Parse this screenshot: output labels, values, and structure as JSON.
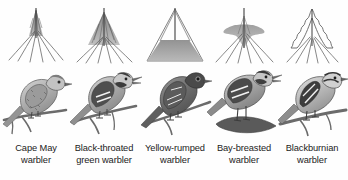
{
  "figure": {
    "background_color": "#fefefe",
    "shade_color": "#999999",
    "line_color": "#4a4a4a",
    "text_color": "#1b1b1b",
    "columns": [
      {
        "id": "cape-may",
        "label_line1": "Cape May",
        "label_line2": "warbler",
        "tree_zone": "top-apex",
        "tree_shaded": true,
        "tree_outline": "straight",
        "bird": {
          "name": "cape-may-warbler",
          "posture": "perched",
          "beak_open": false,
          "body_tone": "light-streaked",
          "perch": "thin-branch"
        }
      },
      {
        "id": "black-throated-green",
        "label_line1": "Black-throated",
        "label_line2": "green warbler",
        "tree_zone": "upper-middle",
        "tree_shaded": true,
        "tree_outline": "straight",
        "bird": {
          "name": "black-throated-green-warbler",
          "posture": "perched",
          "beak_open": true,
          "body_tone": "dark-wings-white-bars",
          "perch": "thin-branch"
        }
      },
      {
        "id": "yellow-rumped",
        "label_line1": "Yellow-rumped",
        "label_line2": "warbler",
        "tree_zone": "lower-trunk",
        "tree_shaded": true,
        "tree_outline": "straight",
        "bird": {
          "name": "yellow-rumped-warbler",
          "posture": "perched",
          "beak_open": false,
          "body_tone": "dark",
          "perch": "thin-branch"
        }
      },
      {
        "id": "bay-breasted",
        "label_line1": "Bay-breasted",
        "label_line2": "warbler",
        "tree_zone": "mid-inner-band",
        "tree_shaded": true,
        "tree_outline": "straight",
        "bird": {
          "name": "bay-breasted-warbler",
          "posture": "perched",
          "beak_open": true,
          "body_tone": "banded-wings",
          "perch": "thick-stub"
        }
      },
      {
        "id": "blackburnian",
        "label_line1": "Blackburnian",
        "label_line2": "warbler",
        "tree_zone": "outer-canopy",
        "tree_shaded": false,
        "tree_outline": "scalloped",
        "bird": {
          "name": "blackburnian-warbler",
          "posture": "perched",
          "beak_open": false,
          "body_tone": "striped-head-light-breast",
          "perch": "thin-branch"
        }
      }
    ]
  }
}
